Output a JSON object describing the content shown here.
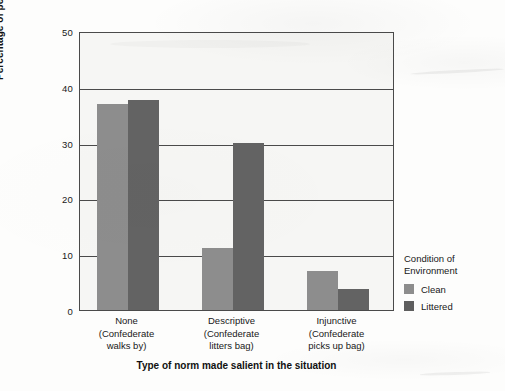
{
  "chart_data": {
    "type": "bar",
    "title": "",
    "xlabel": "Type of norm made salient in the situation",
    "ylabel": "Percentage of people littering",
    "ylim": [
      0,
      50
    ],
    "yticks": [
      0,
      10,
      20,
      30,
      40,
      50
    ],
    "grid": true,
    "legend_position": "right",
    "legend_title": "Condition of\nEnvironment",
    "categories": [
      "None\n(Confederate\nwalks by)",
      "Descriptive\n(Confederate\nlitters bag)",
      "Injunctive\n(Confederate\npicks up bag)"
    ],
    "category_parts": [
      {
        "name": "None",
        "detail_line1": "(Confederate",
        "detail_line2": "walks by)"
      },
      {
        "name": "Descriptive",
        "detail_line1": "(Confederate",
        "detail_line2": "litters bag)"
      },
      {
        "name": "Injunctive",
        "detail_line1": "(Confederate",
        "detail_line2": "picks up bag)"
      }
    ],
    "series": [
      {
        "name": "Clean",
        "color": "#8d8d8d",
        "values": [
          36.9,
          11.2,
          7.0
        ]
      },
      {
        "name": "Littered",
        "color": "#636363",
        "values": [
          37.7,
          30.0,
          3.8
        ]
      }
    ]
  },
  "axes": {
    "y": {
      "title": "Percentage of people littering",
      "ticks": [
        "50",
        "40",
        "30",
        "20",
        "10",
        "0"
      ]
    },
    "x": {
      "title": "Type of norm made salient in the situation"
    }
  },
  "legend": {
    "title_line1": "Condition of",
    "title_line2": "Environment",
    "entries": [
      {
        "label": "Clean",
        "color": "#8d8d8d"
      },
      {
        "label": "Littered",
        "color": "#5e5e5e"
      }
    ]
  },
  "colors": {
    "clean": "#8d8d8d",
    "littered": "#636363",
    "plot_background": "#f6f6f4",
    "frame": "#4a4a4a",
    "page_background": "#fdfdfc"
  }
}
